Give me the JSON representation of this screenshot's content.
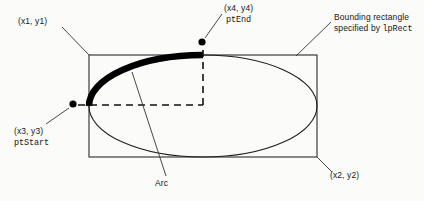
{
  "figure": {
    "background_color": "#fbfbf9",
    "ink_color": "#171717"
  },
  "labels": {
    "top_left_corner": "(x1, y1)",
    "bottom_right_corner": "(x2, y2)",
    "start_point_coords": "(x3, y3)",
    "start_point_name": "ptStart",
    "end_point_coords": "(x4, y4)",
    "end_point_name": "ptEnd",
    "arc": "Arc",
    "bounding_rect_line1": "Bounding rectangle",
    "bounding_rect_line2_prefix": "specified by ",
    "bounding_rect_line2_param": "lpRect"
  },
  "geometry": {
    "rect": {
      "x1": 89,
      "y1": 55,
      "x2": 317,
      "y2": 157
    },
    "ellipse": {
      "cx": 203,
      "cy": 106,
      "rx": 114,
      "ry": 51
    },
    "arc_start_point": {
      "x": 73,
      "y": 104
    },
    "arc_end_point": {
      "x": 202,
      "y": 42
    },
    "arc_sweep": "from left vertex counterclockwise to top of ellipse",
    "dashed_center": {
      "x": 203,
      "y": 105
    }
  }
}
